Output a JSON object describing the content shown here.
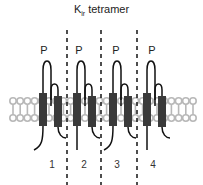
{
  "title": {
    "main": "K",
    "subscript": "ir",
    "suffix": " tetramer"
  },
  "pore_labels": [
    "P",
    "P",
    "P",
    "P"
  ],
  "subunit_labels": [
    "1",
    "2",
    "3",
    "4"
  ],
  "colors": {
    "helix": "#3a3a3a",
    "loop": "#111111",
    "lipid": "#b8b8b8",
    "divider": "#222222"
  }
}
